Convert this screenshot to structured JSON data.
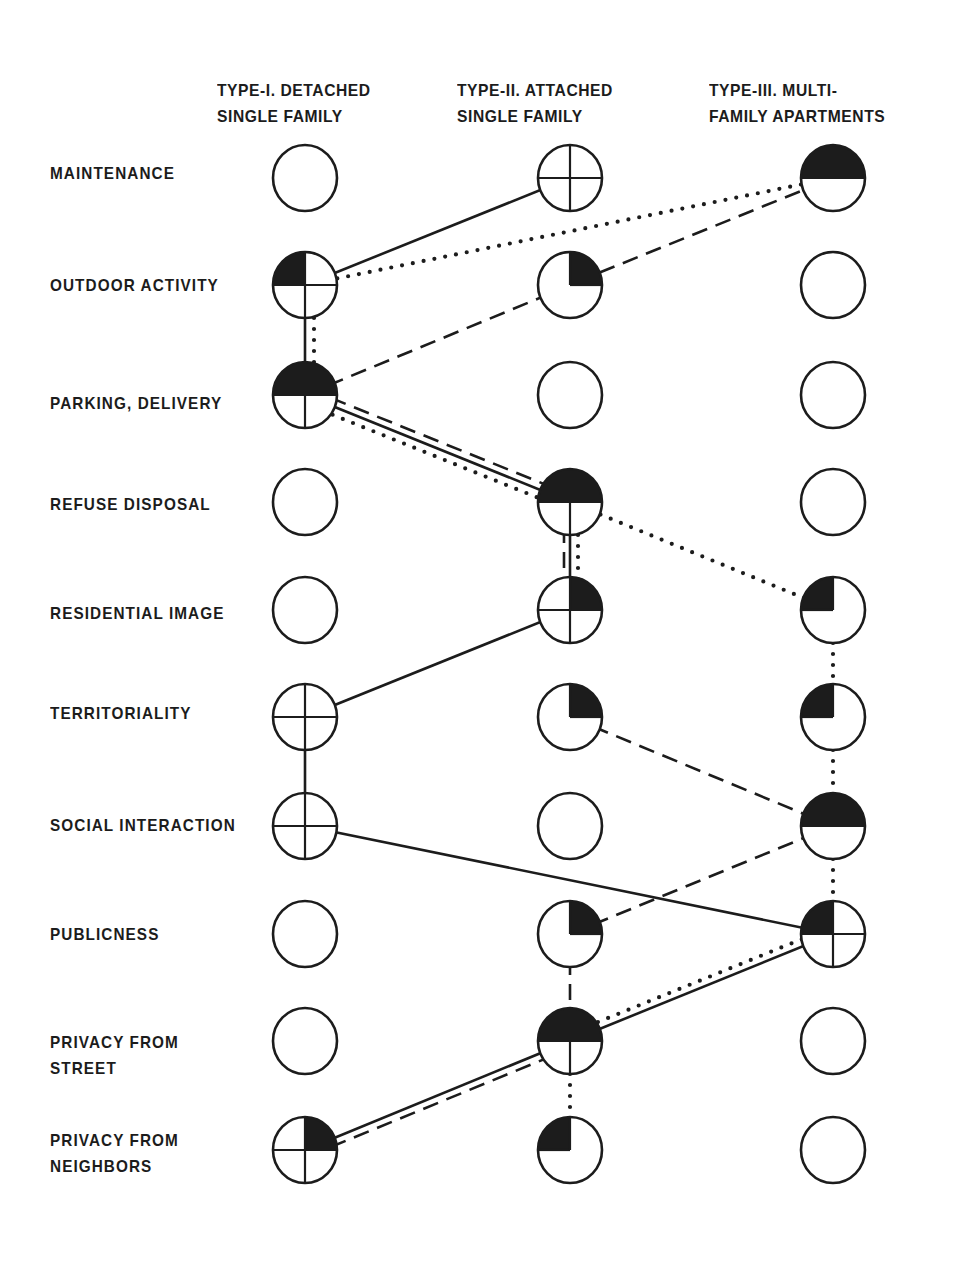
{
  "columns": [
    {
      "id": "type1",
      "line1": "TYPE-I. DETACHED",
      "line2": "SINGLE FAMILY",
      "x": 305
    },
    {
      "id": "type2",
      "line1": "TYPE-II. ATTACHED",
      "line2": "SINGLE FAMILY",
      "x": 570
    },
    {
      "id": "type3",
      "line1": "TYPE-III. MULTI-",
      "line2": "FAMILY APARTMENTS",
      "x": 833
    }
  ],
  "rows": [
    {
      "id": "maintenance",
      "label": "MAINTENANCE",
      "label2": "",
      "y": 178
    },
    {
      "id": "outdoor",
      "label": "OUTDOOR ACTIVITY",
      "label2": "",
      "y": 285
    },
    {
      "id": "parking",
      "label": "PARKING, DELIVERY",
      "label2": "",
      "y": 395
    },
    {
      "id": "refuse",
      "label": "REFUSE DISPOSAL",
      "label2": "",
      "y": 502
    },
    {
      "id": "image",
      "label": "RESIDENTIAL IMAGE",
      "label2": "",
      "y": 610
    },
    {
      "id": "territory",
      "label": "TERRITORIALITY",
      "label2": "",
      "y": 717
    },
    {
      "id": "social",
      "label": "SOCIAL INTERACTION",
      "label2": "",
      "y": 826
    },
    {
      "id": "public",
      "label": "PUBLICNESS",
      "label2": "",
      "y": 934
    },
    {
      "id": "street",
      "label": "PRIVACY FROM",
      "label2": "STREET",
      "y": 1041
    },
    {
      "id": "neighbors",
      "label": "PRIVACY FROM",
      "label2": "NEIGHBORS",
      "y": 1150
    }
  ],
  "symbol_legend": {
    "empty": "open circle",
    "cross": "circle divided in four quarters",
    "cross_tl": "divided circle, top-left quarter filled",
    "cross_tr": "divided circle, top-right quarter filled",
    "half_top_split": "top half filled, bottom half divided",
    "half_top": "top half filled",
    "quarter_tl": "top-left quarter filled",
    "quarter_tr": "top-right quarter filled"
  },
  "nodes": [
    [
      "empty",
      "cross",
      "half_top"
    ],
    [
      "cross_tl",
      "quarter_tr",
      "empty"
    ],
    [
      "half_top_split",
      "empty",
      "empty"
    ],
    [
      "empty",
      "half_top_split",
      "empty"
    ],
    [
      "empty",
      "cross_tr",
      "quarter_tl"
    ],
    [
      "cross",
      "quarter_tr",
      "quarter_tl"
    ],
    [
      "cross",
      "empty",
      "half_top"
    ],
    [
      "empty",
      "quarter_tr",
      "cross_tl"
    ],
    [
      "empty",
      "half_top_split",
      "empty"
    ],
    [
      "cross_tr",
      "quarter_tl",
      "empty"
    ]
  ],
  "edges": [
    {
      "style": "solid",
      "from": [
        1,
        0
      ],
      "to": [
        0,
        1
      ]
    },
    {
      "style": "dotted",
      "from": [
        1,
        0
      ],
      "to": [
        0,
        2
      ]
    },
    {
      "style": "dashed",
      "from": [
        2,
        0
      ],
      "to": [
        0,
        2
      ],
      "via": [
        1,
        1
      ]
    },
    {
      "style": "solid",
      "from": [
        1,
        0
      ],
      "to": [
        2,
        0
      ]
    },
    {
      "style": "dotted",
      "from": [
        1,
        0
      ],
      "to": [
        2,
        0
      ],
      "offset": -9
    },
    {
      "style": "dashed",
      "from": [
        2,
        0
      ],
      "to": [
        3,
        1
      ],
      "offset": -7
    },
    {
      "style": "solid",
      "from": [
        2,
        0
      ],
      "to": [
        3,
        1
      ]
    },
    {
      "style": "dotted",
      "from": [
        2,
        0
      ],
      "to": [
        3,
        1
      ],
      "offset": 8
    },
    {
      "style": "dotted",
      "from": [
        3,
        1
      ],
      "to": [
        4,
        2
      ]
    },
    {
      "style": "dotted",
      "from": [
        3,
        1
      ],
      "to": [
        4,
        1
      ],
      "offset": -8
    },
    {
      "style": "solid",
      "from": [
        3,
        1
      ],
      "to": [
        4,
        1
      ]
    },
    {
      "style": "dashed",
      "from": [
        3,
        1
      ],
      "to": [
        4,
        1
      ],
      "offset": 6
    },
    {
      "style": "solid",
      "from": [
        5,
        0
      ],
      "to": [
        4,
        1
      ]
    },
    {
      "style": "solid",
      "from": [
        5,
        0
      ],
      "to": [
        6,
        0
      ]
    },
    {
      "style": "dashed",
      "from": [
        5,
        1
      ],
      "to": [
        6,
        2
      ]
    },
    {
      "style": "dotted",
      "from": [
        4,
        2
      ],
      "to": [
        5,
        2
      ]
    },
    {
      "style": "dotted",
      "from": [
        5,
        2
      ],
      "to": [
        6,
        2
      ]
    },
    {
      "style": "dotted",
      "from": [
        6,
        2
      ],
      "to": [
        7,
        2
      ]
    },
    {
      "style": "solid",
      "from": [
        6,
        0
      ],
      "to": [
        7,
        2
      ]
    },
    {
      "style": "dashed",
      "from": [
        7,
        1
      ],
      "to": [
        6,
        2
      ]
    },
    {
      "style": "dashed",
      "from": [
        7,
        1
      ],
      "to": [
        8,
        1
      ]
    },
    {
      "style": "solid",
      "from": [
        8,
        1
      ],
      "to": [
        7,
        2
      ]
    },
    {
      "style": "dotted",
      "from": [
        8,
        1
      ],
      "to": [
        7,
        2
      ],
      "offset": -7
    },
    {
      "style": "solid",
      "from": [
        9,
        0
      ],
      "to": [
        8,
        1
      ]
    },
    {
      "style": "dashed",
      "from": [
        9,
        0
      ],
      "to": [
        8,
        1
      ],
      "offset": 7
    },
    {
      "style": "dotted",
      "from": [
        8,
        1
      ],
      "to": [
        9,
        1
      ]
    }
  ],
  "colors": {
    "ink": "#1c1c1c",
    "paper": "#ffffff"
  }
}
